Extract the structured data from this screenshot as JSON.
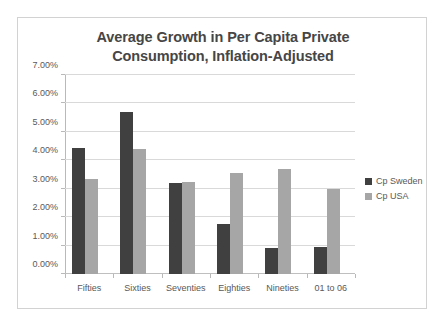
{
  "chart_data": {
    "type": "bar",
    "title": "Average Growth in Per Capita Private Consumption, Inflation-Adjusted",
    "title_line1": "Average Growth in Per Capita Private",
    "title_line2": "Consumption, Inflation-Adjusted",
    "xlabel": "",
    "ylabel": "",
    "categories": [
      "Fifties",
      "Sixties",
      "Seventies",
      "Eighties",
      "Nineties",
      "01 to 06"
    ],
    "series": [
      {
        "name": "Cp Sweden",
        "color": "#404040",
        "values": [
          4.45,
          5.7,
          3.2,
          1.75,
          0.9,
          0.95
        ]
      },
      {
        "name": "Cp USA",
        "color": "#a6a6a6",
        "values": [
          3.35,
          4.4,
          3.25,
          3.55,
          3.7,
          3.0
        ]
      }
    ],
    "ylim": [
      0,
      7
    ],
    "ytick_step": 1,
    "ytick_labels": [
      "0.00%",
      "1.00%",
      "2.00%",
      "3.00%",
      "4.00%",
      "5.00%",
      "6.00%",
      "7.00%"
    ],
    "ytick_values": [
      0,
      1,
      2,
      3,
      4,
      5,
      6,
      7
    ],
    "grid": true,
    "legend_position": "right",
    "value_suffix": "%"
  }
}
